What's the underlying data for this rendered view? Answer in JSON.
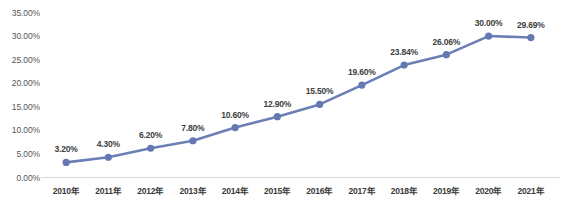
{
  "chart_data": {
    "type": "line",
    "title": "",
    "subtitle": "",
    "xlabel": "",
    "ylabel": "",
    "categories": [
      "2010年",
      "2011年",
      "2012年",
      "2013年",
      "2014年",
      "2015年",
      "2016年",
      "2017年",
      "2018年",
      "2019年",
      "2020年",
      "2021年"
    ],
    "values": [
      3.2,
      4.3,
      6.2,
      7.8,
      10.6,
      12.9,
      15.5,
      19.6,
      23.84,
      26.06,
      30.0,
      29.69
    ],
    "point_labels": [
      "3.20%",
      "4.30%",
      "6.20%",
      "7.80%",
      "10.60%",
      "12.90%",
      "15.50%",
      "19.60%",
      "23.84%",
      "26.06%",
      "30.00%",
      "29.69%"
    ],
    "ylim": [
      0,
      35
    ],
    "ytick_values": [
      0,
      5,
      10,
      15,
      20,
      25,
      30,
      35
    ],
    "ytick_labels": [
      "0.00%",
      "5.00%",
      "10.00%",
      "15.00%",
      "20.00%",
      "25.00%",
      "30.00%",
      "35.00%"
    ],
    "grid": false,
    "legend": false,
    "legend_position": "none",
    "series": [
      {
        "name": "",
        "values": [
          3.2,
          4.3,
          6.2,
          7.8,
          10.6,
          12.9,
          15.5,
          19.6,
          23.84,
          26.06,
          30.0,
          29.69
        ]
      }
    ],
    "colors": {
      "line": "#6b7fb5",
      "marker": "#6479b2",
      "axis": "#d9d9d9",
      "tick_text": "#565656",
      "data_label_text": "#404040",
      "background": "#ffffff"
    }
  }
}
